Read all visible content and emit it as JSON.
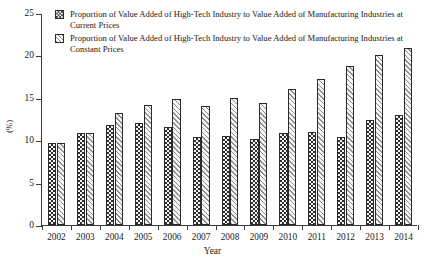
{
  "chart_data": {
    "type": "bar",
    "title": "",
    "xlabel": "Year",
    "ylabel": "(%)",
    "ylim": [
      0,
      25
    ],
    "yticks": [
      0,
      5,
      10,
      15,
      20,
      25
    ],
    "grid": false,
    "legend_position": "top-left",
    "categories": [
      "2002",
      "2003",
      "2004",
      "2005",
      "2006",
      "2007",
      "2008",
      "2009",
      "2010",
      "2011",
      "2012",
      "2013",
      "2014"
    ],
    "series": [
      {
        "name": "Proportion of Value Added of High-Tech Industry to Value Added of Manufacturing Industries at Current Prices",
        "short_name": "Current Prices",
        "pattern": "checkerboard-dark",
        "values": [
          9.7,
          10.9,
          11.8,
          12.0,
          11.6,
          10.4,
          10.5,
          10.1,
          10.8,
          11.0,
          10.4,
          12.4,
          13.0
        ]
      },
      {
        "name": "Proportion of Value Added of High-Tech Industry to Value Added of Manufacturing Industries at Constant Prices",
        "short_name": "Constant Prices",
        "pattern": "diagonal-hatch-light",
        "values": [
          9.7,
          10.9,
          13.2,
          14.2,
          14.9,
          14.0,
          15.0,
          14.4,
          16.0,
          17.2,
          18.7,
          20.1,
          20.9
        ]
      }
    ]
  },
  "legend": {
    "items": [
      {
        "label": "Proportion of Value Added of High-Tech Industry to Value Added of Manufacturing Industries at Current Prices",
        "swatch": "checkerboard-dark-swatch"
      },
      {
        "label": "Proportion of Value Added of High-Tech Industry to Value Added of Manufacturing Industries at Constant Prices",
        "swatch": "diagonal-hatch-light-swatch"
      }
    ]
  },
  "axes": {
    "y_title": "(%)",
    "x_title": "Year"
  },
  "colors": {
    "axis": "#3a3a3a",
    "series_1_fill": "#2e2e2e",
    "series_2_fill": "#8e8e8e",
    "text": "#1a1a1a",
    "background": "#ffffff"
  }
}
